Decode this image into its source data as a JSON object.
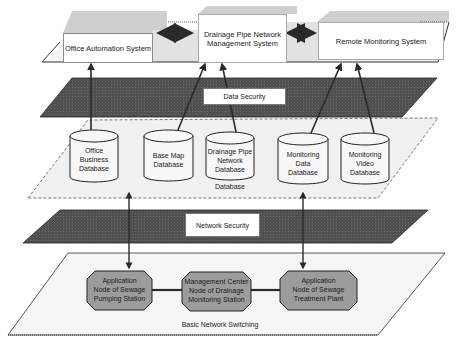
{
  "diagram": {
    "type": "layered-architecture",
    "layers": {
      "application": {
        "systems": [
          {
            "id": "office",
            "label": "Office Automation System"
          },
          {
            "id": "drainage",
            "label_line1": "Drainage Pipe Network",
            "label_line2": "Management System"
          },
          {
            "id": "remote",
            "label": "Remote Monitoring System"
          }
        ],
        "links": [
          {
            "from": "office",
            "to": "drainage",
            "type": "bidirectional"
          },
          {
            "from": "drainage",
            "to": "remote",
            "type": "bidirectional"
          }
        ]
      },
      "data_security": {
        "label": "Data Security"
      },
      "database": {
        "caption": "Database",
        "databases": [
          {
            "id": "office_db",
            "lines": [
              "Office",
              "Business",
              "Database"
            ]
          },
          {
            "id": "basemap_db",
            "lines": [
              "Base Map",
              "Database"
            ]
          },
          {
            "id": "drainage_db",
            "lines": [
              "Drainage Pipe",
              "Network",
              "Database"
            ]
          },
          {
            "id": "mon_data_db",
            "lines": [
              "Monitoring",
              "Data",
              "Database"
            ]
          },
          {
            "id": "mon_video_db",
            "lines": [
              "Monitoring",
              "Video",
              "Database"
            ]
          }
        ]
      },
      "network_security": {
        "label": "Network Security"
      },
      "basic_network": {
        "caption": "Basic Network Switching",
        "nodes": [
          {
            "id": "pumping",
            "lines": [
              "Application",
              "Node of Sewage",
              "Pumping Station"
            ]
          },
          {
            "id": "center",
            "lines": [
              "Management Center",
              "Node of Drainage",
              "Monitoring Station"
            ]
          },
          {
            "id": "treatment",
            "lines": [
              "Application",
              "Node of Sewage",
              "Treatment Plant"
            ]
          }
        ]
      }
    },
    "flows": [
      {
        "from": "office_db",
        "to": "office",
        "direction": "up"
      },
      {
        "from": "basemap_db",
        "to": "drainage",
        "direction": "up"
      },
      {
        "from": "drainage_db",
        "to": "drainage",
        "direction": "up"
      },
      {
        "from": "mon_data_db",
        "to": "remote",
        "direction": "up"
      },
      {
        "from": "mon_video_db",
        "to": "remote",
        "direction": "up"
      },
      {
        "from": "database",
        "to": "basic_network",
        "direction": "bidirectional",
        "count": 2
      }
    ],
    "colors": {
      "security_band": "#4a4a4a",
      "platform_fill": "#f1f1f1",
      "top_shade": "#c9c9c9",
      "node_fill": "#9c9c9c",
      "arrow": "#2a2a2a"
    }
  }
}
